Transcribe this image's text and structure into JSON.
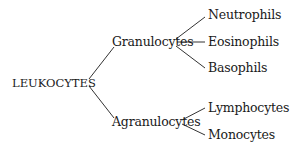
{
  "diagram": {
    "type": "tree",
    "root": {
      "label": "LEUKOCYTES"
    },
    "branches": [
      {
        "label": "Granulocytes",
        "children": [
          {
            "label": "Neutrophils"
          },
          {
            "label": "Eosinophils"
          },
          {
            "label": "Basophils"
          }
        ]
      },
      {
        "label": "Agranulocytes",
        "children": [
          {
            "label": "Lymphocytes"
          },
          {
            "label": "Monocytes"
          }
        ]
      }
    ],
    "colors": {
      "text": "#1a1a1a",
      "lines": "#333333",
      "background": "#ffffff"
    }
  }
}
